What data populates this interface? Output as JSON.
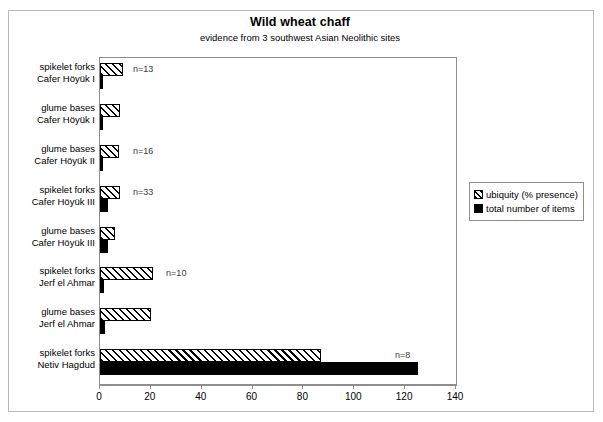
{
  "chart_data": {
    "type": "bar",
    "orientation": "horizontal",
    "title": "Wild wheat chaff",
    "subtitle": "evidence from 3 southwest Asian Neolithic sites",
    "xlabel": "",
    "ylabel": "",
    "xlim": [
      0,
      140
    ],
    "xticks": [
      0,
      20,
      40,
      60,
      80,
      100,
      120,
      140
    ],
    "grid": false,
    "legend_position": "right",
    "categories": [
      "spikelet forks\nCafer Höyük I",
      "glume bases\nCafer Höyük I",
      "glume bases\nCafer Höyük II",
      "spikelet forks\nCafer Höyük III",
      "glume bases\nCafer Höyük III",
      "spikelet forks\nJerf el Ahmar",
      "glume bases\nJerf el Ahmar",
      "spikelet forks\nNetiv Hagdud"
    ],
    "category_lines": [
      [
        "spikelet forks",
        "Cafer Höyük I"
      ],
      [
        "glume bases",
        "Cafer Höyük I"
      ],
      [
        "glume bases",
        "Cafer Höyük II"
      ],
      [
        "spikelet forks",
        "Cafer Höyük III"
      ],
      [
        "glume bases",
        "Cafer Höyük III"
      ],
      [
        "spikelet forks",
        "Jerf el Ahmar"
      ],
      [
        "glume bases",
        "Jerf el Ahmar"
      ],
      [
        "spikelet forks",
        "Netiv Hagdud"
      ]
    ],
    "series": [
      {
        "name": "ubiquity (% presence)",
        "style": "hatched",
        "color": "#000000",
        "values": [
          9,
          8,
          7.5,
          8,
          6,
          21,
          20,
          87
        ]
      },
      {
        "name": "total number of items",
        "style": "solid",
        "color": "#000000",
        "values": [
          1,
          1,
          1,
          3,
          3,
          1.5,
          2,
          125
        ]
      }
    ],
    "annotations": [
      {
        "category_index": 0,
        "text": "n=13",
        "x": 13
      },
      {
        "category_index": 2,
        "text": "n=16",
        "x": 13
      },
      {
        "category_index": 3,
        "text": "n=33",
        "x": 13
      },
      {
        "category_index": 5,
        "text": "n=10",
        "x": 26
      },
      {
        "category_index": 7,
        "text": "n=8",
        "x": 116
      }
    ]
  },
  "legend": {
    "items": [
      {
        "label": "ubiquity (% presence)",
        "style": "hatch"
      },
      {
        "label": "total number of items",
        "style": "solid"
      }
    ]
  },
  "axis": {
    "tick_labels": [
      "0",
      "20",
      "40",
      "60",
      "80",
      "100",
      "120",
      "140"
    ]
  },
  "colors": {
    "frame": "#b9b9bd",
    "plot_border": "#8d8d92",
    "bar": "#000000",
    "background": "#ffffff"
  }
}
